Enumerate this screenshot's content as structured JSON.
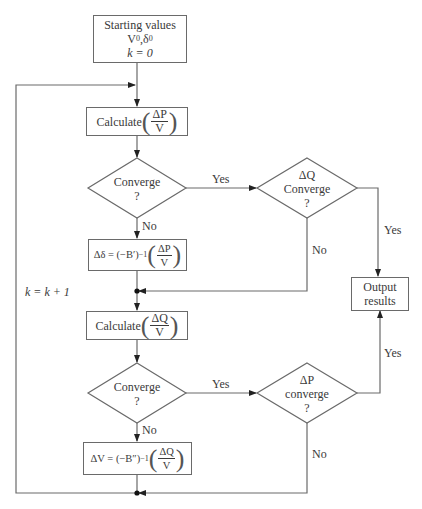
{
  "flowchart": {
    "start": {
      "line1": "Starting values",
      "line2_var1": "V",
      "line2_sup1": "0",
      "line2_sep": ", ",
      "line2_var2": "δ",
      "line2_sup2": "0",
      "line3": "k = 0"
    },
    "calc_p": {
      "label": "Calculate",
      "num": "ΔP",
      "den": "V"
    },
    "converge_1": {
      "line1": "Converge",
      "line2": "?"
    },
    "delta_delta": {
      "lhs": "Δδ = (−B′)",
      "exp": "−1",
      "num": "ΔP",
      "den": "V"
    },
    "dq_converge": {
      "line1": "ΔQ",
      "line2": "Converge",
      "line3": "?"
    },
    "output": {
      "line1": "Output",
      "line2": "results"
    },
    "calc_q": {
      "label": "Calculate",
      "num": "ΔQ",
      "den": "V"
    },
    "converge_2": {
      "line1": "Converge",
      "line2": "?"
    },
    "delta_v": {
      "lhs": "ΔV = (−B″)",
      "exp": "−1",
      "num": "ΔQ",
      "den": "V"
    },
    "dp_converge": {
      "line1": "ΔP",
      "line2": "converge",
      "line3": "?"
    },
    "edge_labels": {
      "c1_yes": "Yes",
      "c1_no": "No",
      "dq_yes": "Yes",
      "dq_no": "No",
      "c2_yes": "Yes",
      "c2_no": "No",
      "dp_yes": "Yes",
      "dp_no": "No",
      "loop": "k = k + 1"
    },
    "colors": {
      "line": "#6a6a6a",
      "text": "#3a3a3a",
      "background": "#ffffff"
    }
  }
}
